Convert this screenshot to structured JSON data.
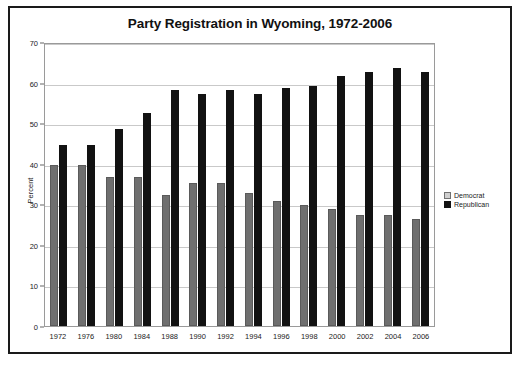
{
  "chart_data": {
    "type": "bar",
    "title": "Party Registration in Wyoming, 1972-2006",
    "xlabel": "",
    "ylabel": "Percent",
    "ylim": [
      0,
      70
    ],
    "yticks": [
      0,
      10,
      20,
      30,
      40,
      50,
      60,
      70
    ],
    "grid": true,
    "legend_position": "right",
    "categories": [
      "1972",
      "1976",
      "1980",
      "1984",
      "1988",
      "1990",
      "1992",
      "1994",
      "1996",
      "1998",
      "2000",
      "2002",
      "2004",
      "2006"
    ],
    "series": [
      {
        "name": "Democrat",
        "color": "#6f6f6f",
        "values": [
          40,
          40,
          37,
          37,
          32.5,
          35.5,
          35.5,
          33,
          31,
          30,
          29,
          27.5,
          27.5,
          26.5
        ]
      },
      {
        "name": "Republican",
        "color": "#121212",
        "values": [
          45,
          45,
          49,
          53,
          58.5,
          57.5,
          58.5,
          57.5,
          59,
          59.5,
          62,
          63,
          64,
          63
        ]
      }
    ]
  },
  "legend": {
    "items": [
      {
        "label": "Democrat",
        "swatch": "dem"
      },
      {
        "label": "Republican",
        "swatch": "rep"
      }
    ]
  }
}
